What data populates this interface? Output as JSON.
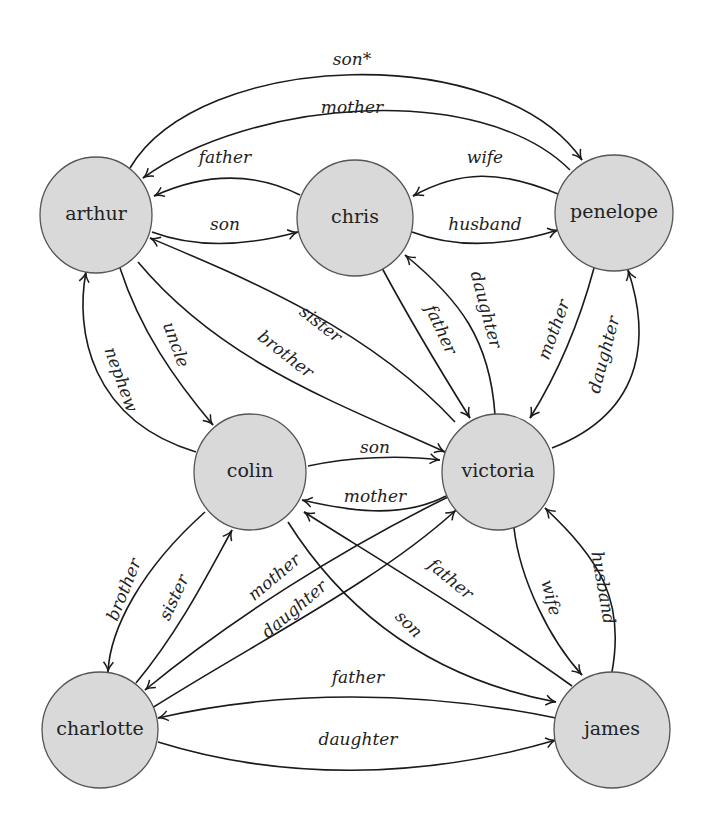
{
  "diagram": {
    "colors": {
      "node_fill": "#d9d9d9",
      "node_stroke": "#555555",
      "edge": "#1a1a1a",
      "text": "#222222",
      "background": "#ffffff"
    },
    "nodes": [
      {
        "id": "arthur",
        "label": "arthur",
        "x": 96,
        "y": 215
      },
      {
        "id": "chris",
        "label": "chris",
        "x": 355,
        "y": 218
      },
      {
        "id": "penelope",
        "label": "penelope",
        "x": 614,
        "y": 213
      },
      {
        "id": "colin",
        "label": "colin",
        "x": 250,
        "y": 472
      },
      {
        "id": "victoria",
        "label": "victoria",
        "x": 498,
        "y": 472
      },
      {
        "id": "charlotte",
        "label": "charlotte",
        "x": 100,
        "y": 730
      },
      {
        "id": "james",
        "label": "james",
        "x": 612,
        "y": 730
      }
    ],
    "edges": [
      {
        "from": "arthur",
        "to": "penelope",
        "label": "son*"
      },
      {
        "from": "penelope",
        "to": "arthur",
        "label": "mother"
      },
      {
        "from": "chris",
        "to": "arthur",
        "label": "father"
      },
      {
        "from": "arthur",
        "to": "chris",
        "label": "son"
      },
      {
        "from": "penelope",
        "to": "chris",
        "label": "wife"
      },
      {
        "from": "chris",
        "to": "penelope",
        "label": "husband"
      },
      {
        "from": "victoria",
        "to": "arthur",
        "label": "sister"
      },
      {
        "from": "arthur",
        "to": "victoria",
        "label": "brother"
      },
      {
        "from": "arthur",
        "to": "colin",
        "label": "uncle"
      },
      {
        "from": "colin",
        "to": "arthur",
        "label": "nephew"
      },
      {
        "from": "chris",
        "to": "victoria",
        "label": "father"
      },
      {
        "from": "victoria",
        "to": "chris",
        "label": "daughter"
      },
      {
        "from": "penelope",
        "to": "victoria",
        "label": "mother"
      },
      {
        "from": "victoria",
        "to": "penelope",
        "label": "daughter"
      },
      {
        "from": "colin",
        "to": "victoria",
        "label": "son"
      },
      {
        "from": "victoria",
        "to": "colin",
        "label": "mother"
      },
      {
        "from": "colin",
        "to": "charlotte",
        "label": "brother"
      },
      {
        "from": "charlotte",
        "to": "colin",
        "label": "sister"
      },
      {
        "from": "victoria",
        "to": "charlotte",
        "label": "mother"
      },
      {
        "from": "charlotte",
        "to": "victoria",
        "label": "daughter"
      },
      {
        "from": "james",
        "to": "colin",
        "label": "father"
      },
      {
        "from": "colin",
        "to": "james",
        "label": "son"
      },
      {
        "from": "victoria",
        "to": "james",
        "label": "wife"
      },
      {
        "from": "james",
        "to": "victoria",
        "label": "husband"
      },
      {
        "from": "james",
        "to": "charlotte",
        "label": "father"
      },
      {
        "from": "charlotte",
        "to": "james",
        "label": "daughter"
      }
    ]
  }
}
